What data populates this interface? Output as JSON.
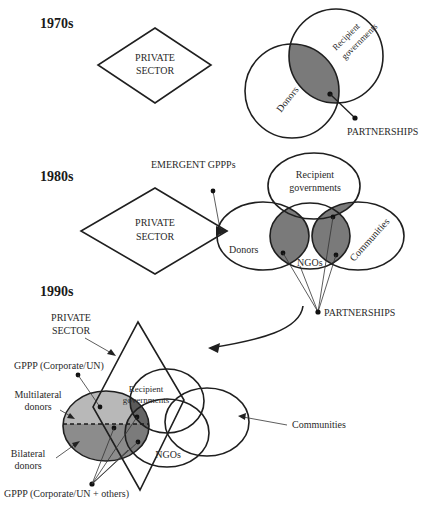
{
  "eras": [
    {
      "label": "1970s",
      "private_sector": [
        "PRIVATE",
        "SECTOR"
      ],
      "circles": {
        "donors": "Donors",
        "recipient_governments": [
          "Recipient",
          "governments"
        ]
      },
      "partnerships": "PARTNERSHIPS"
    },
    {
      "label": "1980s",
      "emergent": "EMERGENT GPPPs",
      "private_sector": [
        "PRIVATE",
        "SECTOR"
      ],
      "circles": {
        "recipient_governments": [
          "Recipient",
          "governments"
        ],
        "donors": "Donors",
        "ngos": "NGOs",
        "communities": "Communities"
      },
      "partnerships": "PARTNERSHIPS"
    },
    {
      "label": "1990s",
      "private_sector": [
        "PRIVATE",
        "SECTOR"
      ],
      "gppp_corporate_un": "GPPP (Corporate/UN)",
      "multilateral_donors": [
        "Multilateral",
        "donors"
      ],
      "bilateral_donors": [
        "Bilateral",
        "donors"
      ],
      "recipient_governments": [
        "Recipient",
        "governments"
      ],
      "ngos": "NGOs",
      "communities": "Communities",
      "gppp_corporate_un_others": "GPPP (Corporate/UN + others)"
    }
  ],
  "colors": {
    "overlap_dark": "#7a7a7a",
    "multilateral_fill": "#b8b8b8",
    "bilateral_fill": "#8c8c8c",
    "overlap_darkest": "#5a5a5a",
    "line": "#1f1f1f"
  }
}
